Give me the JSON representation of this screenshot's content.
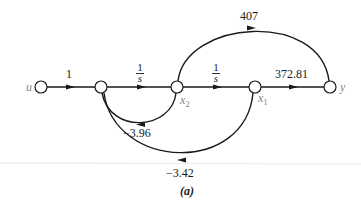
{
  "diagram": {
    "type": "signal-flow-graph",
    "caption": "(a)",
    "nodes": [
      {
        "id": "u",
        "label": "u",
        "x": 41,
        "y": 87
      },
      {
        "id": "n2",
        "label": "",
        "x": 101,
        "y": 87
      },
      {
        "id": "x2",
        "label": "x2",
        "x": 177,
        "y": 87
      },
      {
        "id": "x1",
        "label": "x1",
        "x": 255,
        "y": 87
      },
      {
        "id": "y",
        "label": "y",
        "x": 330,
        "y": 87
      }
    ],
    "edges": [
      {
        "from": "u",
        "to": "n2",
        "gain": "1"
      },
      {
        "from": "n2",
        "to": "x2",
        "gain_num": "1",
        "gain_den": "s"
      },
      {
        "from": "x2",
        "to": "x1",
        "gain_num": "1",
        "gain_den": "s"
      },
      {
        "from": "x1",
        "to": "y",
        "gain": "372.81"
      },
      {
        "from": "x2",
        "to": "y",
        "gain": "407"
      },
      {
        "from": "x2",
        "to": "n2",
        "gain": "−3.96"
      },
      {
        "from": "x1",
        "to": "n2",
        "gain": "−3.42"
      }
    ],
    "labels": {
      "u": "u",
      "x2_base": "x",
      "x2_sub": "2",
      "x1_base": "x",
      "x1_sub": "1",
      "y": "y",
      "g_u_n2": "1",
      "g_n2_x2_num": "1",
      "g_n2_x2_den": "s",
      "g_x2_x1_num": "1",
      "g_x2_x1_den": "s",
      "g_x1_y": "372.81",
      "g_x2_y": "407",
      "g_x2_n2": "−3.96",
      "g_x1_n2": "−3.42",
      "caption": "(a)"
    },
    "colors": {
      "line": "#1a1a1a",
      "node_label": "#888888",
      "text": "#1a1a1a",
      "rule": "#eeeeee"
    }
  }
}
